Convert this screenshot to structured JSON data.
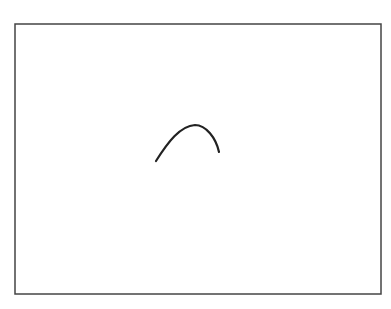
{
  "canvas": {
    "background": "#ffffff",
    "frame": {
      "x": 15,
      "y": 24,
      "width": 366,
      "height": 270,
      "stroke": "#444444",
      "stroke_width": 1.5
    },
    "strokes": [
      {
        "shape": "arc",
        "color": "#222222",
        "width": 2.2,
        "path": "M156,161 C168,142 180,126 195,125 C206,125 216,138 219,152"
      }
    ]
  }
}
